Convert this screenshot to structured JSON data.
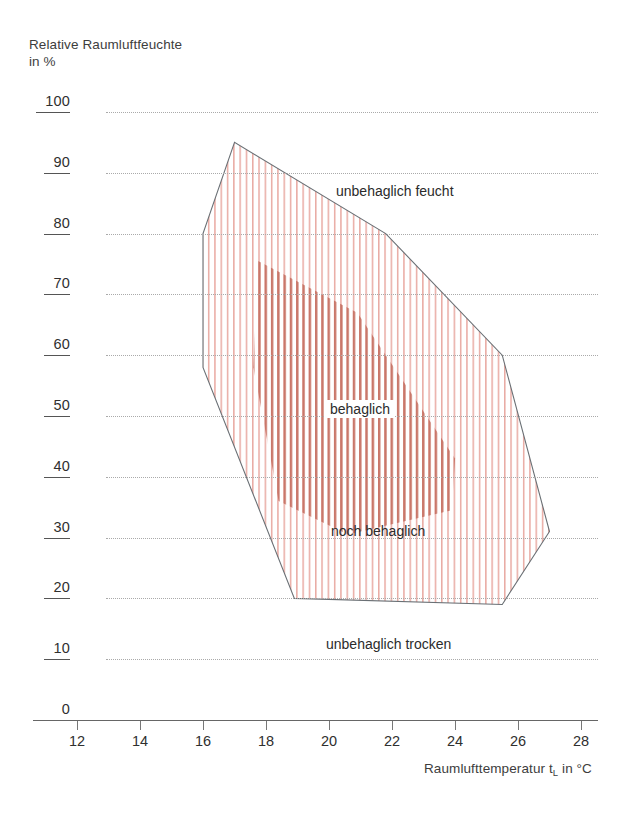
{
  "chart_data": {
    "type": "area",
    "title": "",
    "ylabel": "Relative Raumluftfeuchte\nin %",
    "xlabel": "Raumlufttemperatur t_L in °C",
    "xlabel_main": "Raumlufttemperatur t",
    "xlabel_sub": "L",
    "xlabel_tail": " in °C",
    "xlim": [
      11,
      29
    ],
    "ylim": [
      0,
      100
    ],
    "xticks": [
      12,
      14,
      16,
      18,
      20,
      22,
      24,
      26,
      28
    ],
    "yticks": [
      0,
      10,
      20,
      30,
      40,
      50,
      60,
      70,
      80,
      90,
      100
    ],
    "grid": "horizontal-dotted",
    "legend": "none",
    "outline_color": "#6a7075",
    "hatch_color": "#e8a7a0",
    "hatch_color_dense": "#c76f63",
    "grid_color": "#aaaaaa",
    "series": [
      {
        "name": "noch behaglich",
        "kind": "polygon",
        "points": [
          [
            17.0,
            95.0
          ],
          [
            16.0,
            80.0
          ],
          [
            16.0,
            58.0
          ],
          [
            18.9,
            20.0
          ],
          [
            25.5,
            19.0
          ],
          [
            27.0,
            31.0
          ],
          [
            25.5,
            60.0
          ],
          [
            21.8,
            80.0
          ]
        ]
      },
      {
        "name": "behaglich",
        "kind": "polygon",
        "points": [
          [
            17.75,
            75.5
          ],
          [
            20.9,
            67.0
          ],
          [
            24.0,
            43.0
          ],
          [
            23.9,
            34.5
          ],
          [
            20.6,
            30.5
          ],
          [
            18.4,
            36.0
          ],
          [
            17.6,
            58.0
          ]
        ]
      }
    ],
    "annotations": [
      {
        "text": "unbehaglich feucht",
        "x_px": 331,
        "y_px": 182
      },
      {
        "text": "behaglich",
        "x_px": 325,
        "y_px": 400,
        "boxed": true
      },
      {
        "text": "noch behaglich",
        "x_px": 326,
        "y_px": 522
      },
      {
        "text": "unbehaglich trocken",
        "x_px": 321,
        "y_px": 635
      }
    ]
  },
  "axes": {
    "y_title": "Relative Raumluftfeuchte\nin %",
    "y_tick_labels": [
      "100",
      "90",
      "80",
      "70",
      "60",
      "50",
      "40",
      "30",
      "20",
      "10",
      "0"
    ],
    "x_tick_labels": [
      "12",
      "14",
      "16",
      "18",
      "20",
      "22",
      "24",
      "26",
      "28"
    ]
  }
}
